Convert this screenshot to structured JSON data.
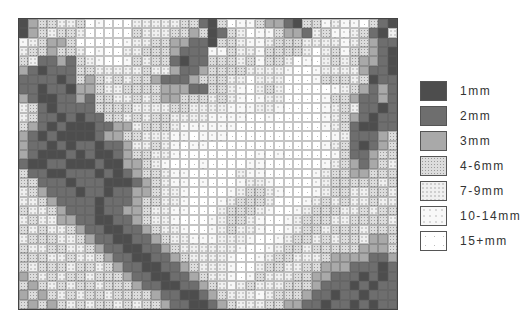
{
  "map": {
    "columns": 40,
    "rows": 31,
    "category_legend_index_note": "0=1mm,1=2mm,2=3mm,3=4-6mm,4=7-9mm,5=10-14mm,6=15+mm",
    "grid": [
      "0233443656664444433103655322103354556310",
      "0234334666663444332301346553221435543104",
      "5432236666654433221103345543334444543211",
      "4332334656644333211155344533334643533210",
      "3411213456653433101133343533465643432210",
      "2101113344444344211233334444566544442110",
      "1111013234343321112333446444666533343011",
      "1101102234433332221133456434666665432121",
      "2100112133443432233343456544666653321121",
      "4310111133334444334444555445666654341101",
      "4311010113343433444455556656666654321011",
      "3210100011224333455555566666666654310011",
      "2101000012233444556555666666666665411123",
      "2110101101124434565566666666666654310123",
      "2100010100123344566666666565666665311233",
      "1001100010022345666566665566666654321234",
      "3110011101012334556666645566666543322333",
      "3311101110001234556566654456666543333343",
      "4321110110112234456666543345666543344334",
      "4432111101112334456665433346665434344344",
      "3443211101122344556664333456654333443433",
      "4344221100112344566654334566543334433334",
      "3434432110011234456654344566543343334333",
      "4333443211001123445554445665433434334223",
      "3443344321100112344444456654334333332223",
      "3334434432110011234444566543344432222112",
      "3433343343211001123444566433443322211101",
      "2343433433321100112344565344433221110101",
      "3234343343332110011234543444333211101011",
      "2323434334333321100123444543332110110111",
      "3232343433434332110012344433221101101011"
    ]
  },
  "legend": {
    "items": [
      {
        "label": "1mm",
        "color": "#4d4d4d"
      },
      {
        "label": "2mm",
        "color": "#6e6e6e"
      },
      {
        "label": "3mm",
        "color": "#a9a9a9"
      },
      {
        "label": "4-6mm",
        "color": "#dcdcdc"
      },
      {
        "label": "7-9mm",
        "color": "#f0f0f0"
      },
      {
        "label": "10-14mm",
        "color": "#f8f8f8"
      },
      {
        "label": "15+mm",
        "color": "#ffffff"
      }
    ]
  }
}
